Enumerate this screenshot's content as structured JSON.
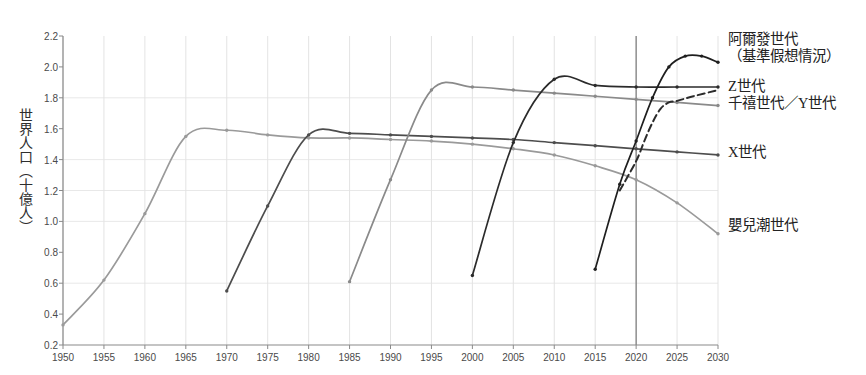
{
  "chart_data": {
    "type": "line",
    "title": "",
    "xlabel": "",
    "ylabel": "世界人口（十億人）",
    "xlim": [
      1950,
      2030
    ],
    "ylim": [
      0.2,
      2.2
    ],
    "xticks": [
      1950,
      1955,
      1960,
      1965,
      1970,
      1975,
      1980,
      1985,
      1990,
      1995,
      2000,
      2005,
      2010,
      2015,
      2020,
      2025,
      2030
    ],
    "yticks": [
      "0.2",
      "0.4",
      "0.6",
      "0.8",
      "1.0",
      "1.2",
      "1.4",
      "1.6",
      "1.8",
      "2.0",
      "2.2"
    ],
    "grid": true,
    "legend_position": "right-inline",
    "annotations": [
      {
        "name": "present-day-marker",
        "type": "vline",
        "x": 2020
      }
    ],
    "series": [
      {
        "name": "嬰兒潮世代",
        "label_lines": [
          "嬰兒潮世代"
        ],
        "color": "#9a9a9a",
        "style": "solid",
        "label_x": 2031,
        "label_y": 0.97,
        "x": [
          1950,
          1955,
          1960,
          1965,
          1970,
          1975,
          1980,
          1985,
          1990,
          1995,
          2000,
          2005,
          2010,
          2015,
          2020,
          2025,
          2030
        ],
        "y": [
          0.33,
          0.62,
          1.05,
          1.55,
          1.59,
          1.56,
          1.54,
          1.54,
          1.53,
          1.52,
          1.5,
          1.47,
          1.43,
          1.36,
          1.27,
          1.12,
          0.92
        ]
      },
      {
        "name": "X世代",
        "label_lines": [
          "X世代"
        ],
        "color": "#4d4d4d",
        "style": "solid",
        "label_x": 2031,
        "label_y": 1.44,
        "x": [
          1970,
          1975,
          1980,
          1985,
          1990,
          1995,
          2000,
          2005,
          2010,
          2015,
          2020,
          2025,
          2030
        ],
        "y": [
          0.55,
          1.1,
          1.56,
          1.57,
          1.56,
          1.55,
          1.54,
          1.53,
          1.51,
          1.49,
          1.47,
          1.45,
          1.43
        ]
      },
      {
        "name": "千禧世代／Y世代",
        "label_lines": [
          "千禧世代／Y世代"
        ],
        "color": "#8a8a8a",
        "style": "solid",
        "label_x": 2031,
        "label_y": 1.76,
        "x": [
          1985,
          1990,
          1995,
          2000,
          2005,
          2010,
          2015,
          2020,
          2025,
          2030
        ],
        "y": [
          0.61,
          1.27,
          1.85,
          1.87,
          1.85,
          1.83,
          1.81,
          1.79,
          1.77,
          1.75
        ]
      },
      {
        "name": "Z世代",
        "label_lines": [
          "Z世代"
        ],
        "color": "#2b2b2b",
        "style": "solid",
        "label_x": 2031,
        "label_y": 1.87,
        "x": [
          2000,
          2005,
          2010,
          2015,
          2020,
          2025,
          2030
        ],
        "y": [
          0.65,
          1.51,
          1.92,
          1.88,
          1.87,
          1.87,
          1.87
        ]
      },
      {
        "name": "Z世代（推估）",
        "label_lines": [],
        "color": "#2b2b2b",
        "style": "dashed",
        "x": [
          2018,
          2020,
          2021,
          2022,
          2023,
          2024,
          2025,
          2027,
          2030
        ],
        "y": [
          1.2,
          1.39,
          1.52,
          1.64,
          1.73,
          1.77,
          1.78,
          1.81,
          1.85
        ]
      },
      {
        "name": "阿爾發世代（基準假想情況）",
        "label_lines": [
          "阿爾發世代",
          "（基準假想情況）"
        ],
        "color": "#1f1f1f",
        "style": "solid",
        "label_x": 2031,
        "label_y": 2.12,
        "x": [
          2015,
          2018,
          2020,
          2022,
          2024,
          2026,
          2028,
          2030
        ],
        "y": [
          0.69,
          1.24,
          1.52,
          1.8,
          2.0,
          2.07,
          2.07,
          2.03
        ]
      }
    ]
  }
}
